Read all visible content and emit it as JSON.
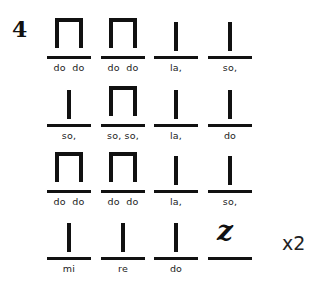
{
  "exercise": {
    "number": "4",
    "repeat": "x2"
  },
  "rows": [
    {
      "cells": [
        {
          "rhythm": "ti-ti",
          "label": "do  do"
        },
        {
          "rhythm": "ti-ti",
          "label": "do  do"
        },
        {
          "rhythm": "ta",
          "label": "la,"
        },
        {
          "rhythm": "ta",
          "label": "so,"
        }
      ]
    },
    {
      "cells": [
        {
          "rhythm": "ta",
          "label": "so,"
        },
        {
          "rhythm": "ti-ti",
          "label": "so, so,"
        },
        {
          "rhythm": "ta",
          "label": "la,"
        },
        {
          "rhythm": "ta",
          "label": "do"
        }
      ]
    },
    {
      "cells": [
        {
          "rhythm": "ti-ti",
          "label": "do  do"
        },
        {
          "rhythm": "ti-ti",
          "label": "do  do"
        },
        {
          "rhythm": "ta",
          "label": "la,"
        },
        {
          "rhythm": "ta",
          "label": "so,"
        }
      ]
    },
    {
      "cells": [
        {
          "rhythm": "ta",
          "label": "mi"
        },
        {
          "rhythm": "ta",
          "label": "re"
        },
        {
          "rhythm": "ta",
          "label": "do"
        },
        {
          "rhythm": "rest",
          "label": "",
          "glyph": "z"
        }
      ]
    }
  ]
}
